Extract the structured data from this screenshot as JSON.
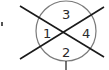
{
  "diagram": {
    "type": "quadrant-circle",
    "circle": {
      "cx": 66,
      "cy": 31,
      "r": 30,
      "stroke": "#7a7a7a"
    },
    "line_color": "#1a1a1a",
    "regions": [
      {
        "id": "left",
        "label": "1"
      },
      {
        "id": "bottom",
        "label": "2"
      },
      {
        "id": "top",
        "label": "3"
      },
      {
        "id": "right",
        "label": "4"
      }
    ]
  }
}
